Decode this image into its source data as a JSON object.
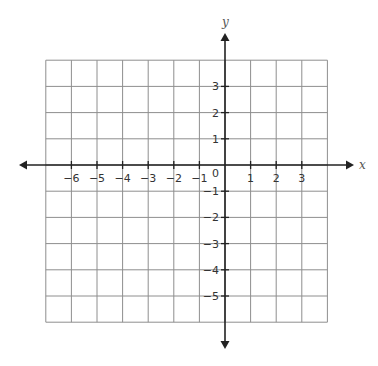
{
  "chart_data": {
    "type": "line",
    "title": "",
    "xlabel": "x",
    "ylabel": "y",
    "grid": true,
    "grid_x_range": [
      -7,
      4
    ],
    "grid_y_range": [
      -6,
      4
    ],
    "x_ticks": [
      -6,
      -5,
      -4,
      -3,
      -2,
      -1,
      1,
      2,
      3
    ],
    "y_ticks": [
      3,
      2,
      1,
      -1,
      -2,
      -3,
      -4,
      -5
    ],
    "x_tick_labels": [
      "−6",
      "−5",
      "−4",
      "−3",
      "−2",
      "−1",
      "1",
      "2",
      "3"
    ],
    "y_tick_labels": [
      "3",
      "2",
      "1",
      "−1",
      "−2",
      "−3",
      "−4",
      "−5"
    ],
    "origin_label": "0",
    "series": [],
    "axes_arrows": {
      "x": "both",
      "y": "both"
    }
  },
  "colors": {
    "axis": "#222222",
    "grid": "#8e8e8e",
    "tick_label": "#333333",
    "axis_label": "#555555",
    "background": "#ffffff"
  },
  "layout": {
    "origin_px": [
      225,
      165
    ],
    "unit_x_px": 25.6,
    "unit_y_px": 26.2,
    "x_axis_extent_px": [
      19,
      354
    ],
    "y_axis_extent_px": [
      33,
      349
    ]
  }
}
